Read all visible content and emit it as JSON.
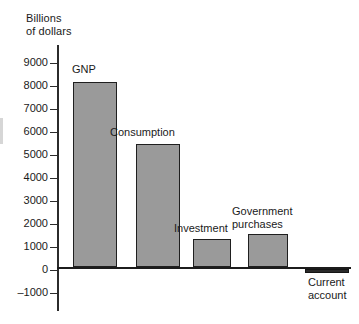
{
  "chart_data": {
    "type": "bar",
    "title": "",
    "subtitle": "",
    "ylabel": "Billions\nof dollars",
    "xlabel": "",
    "ylim": [
      -1000,
      9400
    ],
    "yticks": [
      9000,
      8000,
      7000,
      6000,
      5000,
      4000,
      3000,
      2000,
      1000,
      0,
      -1000
    ],
    "ytick_labels": [
      "9000",
      "8000",
      "7000",
      "6000",
      "5000",
      "4000",
      "3000",
      "2000",
      "1000",
      "0",
      "–1000"
    ],
    "grid": false,
    "legend": false,
    "categories": [
      "GNP",
      "Consumption",
      "Investment",
      "Government purchases",
      "Current account"
    ],
    "values": [
      8100,
      5400,
      1250,
      1450,
      -200
    ],
    "bar_color": "#9a9a9a",
    "bar_edge_color": "#1f1f1f",
    "negative_bar_color": "#2a2a2a",
    "axis_color": "#2b2b2b",
    "background_color": "#ffffff",
    "annotations": [
      {
        "text": "GNP",
        "placement": "above-bar"
      },
      {
        "text": "Consumption",
        "placement": "above-bar"
      },
      {
        "text": "Investment",
        "placement": "above-bar"
      },
      {
        "text": "Government\npurchases",
        "placement": "above-bar"
      },
      {
        "text": "Current\naccount",
        "placement": "below-bar"
      }
    ]
  },
  "axis": {
    "title": "Billions\nof dollars",
    "ticks": [
      {
        "value": "9000",
        "top": 63
      },
      {
        "value": "8000",
        "top": 86
      },
      {
        "value": "7000",
        "top": 109
      },
      {
        "value": "6000",
        "top": 132
      },
      {
        "value": "5000",
        "top": 155
      },
      {
        "value": "4000",
        "top": 178
      },
      {
        "value": "3000",
        "top": 201
      },
      {
        "value": "2000",
        "top": 224
      },
      {
        "value": "1000",
        "top": 247
      },
      {
        "value": "0",
        "top": 270
      },
      {
        "value": "–1000",
        "top": 293
      }
    ]
  },
  "bars": [
    {
      "name": "gnp",
      "label": "GNP",
      "left": 73,
      "width": 44,
      "top": 82,
      "height": 185,
      "label_left": 72,
      "label_top": 63,
      "negative": false
    },
    {
      "name": "consumption",
      "label": "Consumption",
      "left": 136,
      "width": 44,
      "top": 144,
      "height": 123,
      "label_left": 110,
      "label_top": 126,
      "negative": false
    },
    {
      "name": "investment",
      "label": "Investment",
      "left": 193,
      "width": 38,
      "top": 239,
      "height": 28,
      "label_left": 174,
      "label_top": 222,
      "negative": false
    },
    {
      "name": "government-purchases",
      "label": "Government\npurchases",
      "left": 248,
      "width": 40,
      "top": 234,
      "height": 33,
      "label_left": 232,
      "label_top": 205,
      "negative": false
    },
    {
      "name": "current-account",
      "label": "Current\naccount",
      "left": 305,
      "width": 44,
      "top": 269,
      "height": 4,
      "label_left": 308,
      "label_top": 276,
      "negative": true
    }
  ]
}
